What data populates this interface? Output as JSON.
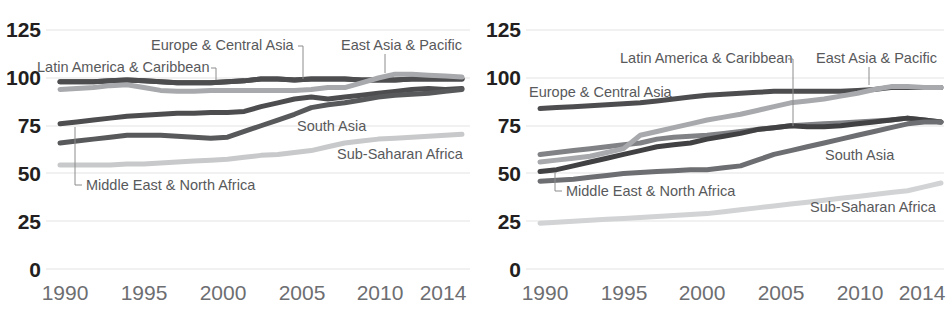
{
  "chart_data": [
    {
      "type": "line",
      "panel": "left",
      "title": "",
      "xlabel": "",
      "ylabel": "",
      "xlim": [
        1990,
        2014
      ],
      "ylim": [
        0,
        125
      ],
      "grid": true,
      "legend_position": "inline-annotations",
      "xticks": [
        1990,
        1995,
        2000,
        2005,
        2010,
        2014
      ],
      "yticks": [
        0,
        25,
        50,
        75,
        100,
        125
      ],
      "x": [
        1990,
        1991,
        1992,
        1993,
        1994,
        1995,
        1996,
        1997,
        1998,
        1999,
        2000,
        2001,
        2002,
        2003,
        2004,
        2005,
        2006,
        2007,
        2008,
        2009,
        2010,
        2011,
        2012,
        2013,
        2014
      ],
      "series": [
        {
          "name": "Latin America & Caribbean",
          "color": "#4d4d4f",
          "label_x": 1990.1,
          "label_y": 108,
          "values": [
            98,
            98,
            98,
            98.5,
            99,
            98.5,
            98,
            97.5,
            97.5,
            97.5,
            98,
            98.5,
            99.5,
            99.5,
            99,
            99.5,
            99.5,
            99.5,
            99,
            99,
            99,
            99.5,
            99.5,
            99.5,
            99.5
          ]
        },
        {
          "name": "Europe & Central Asia",
          "color": "#4d4d4f",
          "label_x": 2000.0,
          "label_y": 116,
          "values": [
            98,
            98,
            98,
            98.5,
            99,
            98.5,
            98,
            97.5,
            97.5,
            97.5,
            98,
            98.5,
            99.5,
            99.5,
            99,
            99.5,
            99.5,
            99.5,
            99,
            99,
            99,
            99.5,
            99.5,
            99.5,
            99.5
          ]
        },
        {
          "name": "East Asia & Pacific",
          "color": "#a7a9ac",
          "label_x": 2008.2,
          "label_y": 116,
          "values": [
            94,
            94.5,
            95,
            96,
            96.5,
            95,
            93.5,
            93,
            93,
            93.5,
            93.5,
            93.5,
            93.5,
            93.5,
            93.5,
            94,
            95,
            95,
            97.5,
            100,
            102,
            102,
            101.5,
            101,
            100.5
          ]
        },
        {
          "name": "Middle East & North Africa",
          "color": "#4d4d4f",
          "label_x": 1991.6,
          "label_y": 42,
          "values": [
            76,
            77,
            78,
            79,
            80,
            80.5,
            81,
            81.5,
            81.5,
            82,
            82,
            82.5,
            85,
            87,
            89,
            90,
            89,
            90,
            91,
            92,
            93,
            94,
            94.5,
            94,
            94.5
          ]
        },
        {
          "name": "South Asia",
          "color": "#58595b",
          "label_x": 2004.2,
          "label_y": 74,
          "values": [
            66,
            67,
            68,
            69,
            70,
            70,
            70,
            69.5,
            69,
            68.5,
            69,
            72,
            75,
            78,
            81,
            84.5,
            86,
            87,
            88.5,
            90,
            91,
            91.5,
            92,
            93,
            94
          ]
        },
        {
          "name": "Sub-Saharan Africa",
          "color": "#c8c9ca",
          "label_x": 2005.5,
          "label_y": 57,
          "values": [
            54.5,
            54.5,
            54.5,
            54.5,
            55,
            55,
            55.5,
            56,
            56.5,
            57,
            57.5,
            58.5,
            59.5,
            60,
            61,
            62,
            64,
            66,
            67,
            68,
            68.5,
            69,
            69.5,
            70,
            70.5
          ]
        }
      ]
    },
    {
      "type": "line",
      "panel": "right",
      "title": "",
      "xlabel": "",
      "ylabel": "",
      "xlim": [
        1990,
        2014
      ],
      "ylim": [
        0,
        125
      ],
      "grid": true,
      "legend_position": "inline-annotations",
      "xticks": [
        1990,
        1995,
        2000,
        2005,
        2010,
        2014
      ],
      "yticks": [
        0,
        25,
        50,
        75,
        100,
        125
      ],
      "x": [
        1990,
        1991,
        1992,
        1993,
        1994,
        1995,
        1996,
        1997,
        1998,
        1999,
        2000,
        2001,
        2002,
        2003,
        2004,
        2005,
        2006,
        2007,
        2008,
        2009,
        2010,
        2011,
        2012,
        2013,
        2014
      ],
      "series": [
        {
          "name": "Europe & Central Asia",
          "color": "#4d4d4f",
          "label_x": 1990.1,
          "label_y": 95,
          "values": [
            84,
            84.5,
            85,
            85.5,
            86,
            86.5,
            87,
            88,
            89,
            90,
            91,
            91.5,
            92,
            92.5,
            93,
            93,
            93,
            93,
            93,
            93.5,
            94,
            95,
            95,
            95,
            95
          ]
        },
        {
          "name": "Latin America & Caribbean",
          "color": "#808285",
          "label_x": 1998.8,
          "label_y": 116,
          "values": [
            60,
            61,
            62,
            63,
            64,
            65,
            66,
            68,
            69,
            69.5,
            70,
            71,
            72,
            73,
            74,
            75,
            75.5,
            76,
            76.5,
            77,
            77.5,
            78,
            79,
            78,
            77
          ]
        },
        {
          "name": "East Asia & Pacific",
          "color": "#a7a9ac",
          "label_x": 2008.3,
          "label_y": 116,
          "values": [
            56,
            57,
            58,
            59,
            61,
            63,
            70,
            72,
            74,
            76,
            78,
            79.5,
            81,
            83,
            85,
            87,
            88,
            89,
            90.5,
            92,
            94,
            95.5,
            95.5,
            95,
            95
          ]
        },
        {
          "name": "Middle East & North Africa",
          "color": "#414042",
          "label_x": 1991.6,
          "label_y": 39,
          "values": [
            51,
            52,
            54,
            56,
            58,
            60,
            62,
            64,
            65,
            66,
            68,
            69.5,
            71,
            73,
            74,
            75,
            74.5,
            74.5,
            75,
            76,
            77,
            78,
            79,
            78,
            77
          ]
        },
        {
          "name": "South Asia",
          "color": "#6d6e71",
          "label_x": 2007.0,
          "label_y": 57,
          "values": [
            46,
            46.5,
            47,
            48,
            49,
            50,
            50.5,
            51,
            51.5,
            52,
            52,
            53,
            54,
            57,
            60,
            62,
            64,
            66,
            68,
            70,
            72,
            74,
            76,
            77,
            77
          ]
        },
        {
          "name": "Sub-Saharan Africa",
          "color": "#d1d3d4",
          "label_x": 2006.5,
          "label_y": 34,
          "values": [
            24,
            24.5,
            25,
            25.5,
            26,
            26.5,
            27,
            27.5,
            28,
            28.5,
            29,
            30,
            31,
            32,
            33,
            34,
            35,
            36,
            37,
            38,
            39,
            40,
            41,
            43,
            45
          ]
        }
      ]
    }
  ]
}
